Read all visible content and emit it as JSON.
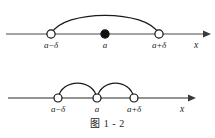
{
  "figure": {
    "caption": "图 1 - 2",
    "caption_label": "图",
    "caption_number": "1 - 2"
  },
  "diagrams": [
    {
      "id": "upper",
      "axis_label": "x",
      "description": "number line with a large single arc spanning the full delta-neighbourhood of a",
      "points": [
        {
          "label": "a−δ",
          "marker": "open-circle",
          "x": 51
        },
        {
          "label": "a",
          "marker": "filled-circle",
          "x": 105
        },
        {
          "label": "a+δ",
          "marker": "open-circle",
          "x": 159
        }
      ],
      "arcs": [
        {
          "from": "a−δ",
          "to": "a+δ",
          "apex_y": 12
        }
      ]
    },
    {
      "id": "lower",
      "axis_label": "x",
      "description": "number line with two small arcs: the deleted (punctured) delta-neighbourhood of a",
      "points": [
        {
          "label": "a−δ",
          "marker": "open-circle",
          "x": 58
        },
        {
          "label": "a",
          "marker": "open-circle",
          "x": 97
        },
        {
          "label": "a+δ",
          "marker": "open-circle",
          "x": 134
        }
      ],
      "arcs": [
        {
          "from": "a−δ",
          "to": "a",
          "apex_y": 80
        },
        {
          "from": "a",
          "to": "a+δ",
          "apex_y": 80
        }
      ]
    }
  ],
  "colors": {
    "stroke": "#1a1a1a",
    "axis": "#4a4a4a",
    "marker_fill": "#ffffff",
    "marker_solid": "#101010",
    "background": "#ffffff"
  }
}
